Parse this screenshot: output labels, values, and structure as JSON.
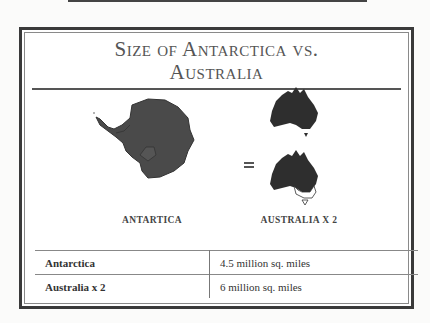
{
  "title": "Size of Antarctica vs. Australia",
  "title_lines": [
    "Size of Antarctica vs.",
    "Australia"
  ],
  "figure": {
    "left_caption": "ANTARTICA",
    "operator": "=",
    "right_caption": "AUSTRALIA X 2",
    "left_icon": "antarctica-map-icon",
    "right_icons": [
      "australia-map-icon",
      "australia-map-icon"
    ],
    "map_color": "#4a4a4a"
  },
  "table": {
    "rows": [
      {
        "label": "Antarctica",
        "value": "4.5 million sq. miles"
      },
      {
        "label": "Australia x 2",
        "value": "6 million sq. miles"
      }
    ]
  }
}
